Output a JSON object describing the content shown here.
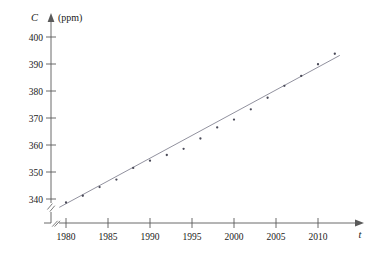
{
  "chart_data": {
    "type": "scatter",
    "title": "",
    "subtitle": "",
    "xlabel": "t",
    "ylabel": "C",
    "ylabel_units": "(ppm)",
    "ylabel_full": "C (ppm)",
    "xlim": [
      1978.2,
      2013.0
    ],
    "ylim": [
      336.0,
      402.5
    ],
    "grid": false,
    "legend": "none",
    "axis_break_x": true,
    "axis_break_y": true,
    "x_ticks": [
      1980,
      1985,
      1990,
      1995,
      2000,
      2005,
      2010
    ],
    "x_tick_labels": [
      "1980",
      "1985",
      "1990",
      "1995",
      "2000",
      "2005",
      "2010"
    ],
    "y_ticks": [
      340,
      350,
      360,
      370,
      380,
      390,
      400
    ],
    "y_tick_labels": [
      "340",
      "350",
      "360",
      "370",
      "380",
      "390",
      "400"
    ],
    "series": [
      {
        "name": "Average CO2 level",
        "type": "scatter",
        "x": [
          1980,
          1982,
          1984,
          1986,
          1988,
          1990,
          1992,
          1994,
          1996,
          1998,
          2000,
          2002,
          2004,
          2006,
          2008,
          2010,
          2012
        ],
        "y": [
          338.7,
          341.2,
          344.4,
          347.2,
          351.5,
          354.2,
          356.3,
          358.6,
          362.4,
          366.5,
          369.4,
          373.2,
          377.5,
          381.9,
          385.6,
          389.9,
          393.8
        ]
      },
      {
        "name": "Linear regression line",
        "type": "line",
        "x": [
          1979.2,
          2012.6
        ],
        "y": [
          336.9,
          393.2
        ]
      }
    ],
    "annotations": []
  },
  "colors": {
    "axis": "#5a5a5a",
    "point": "#4a4a58",
    "fit_line": "#7d7d8c",
    "text": "#1a1a1a",
    "background": "#ffffff"
  }
}
